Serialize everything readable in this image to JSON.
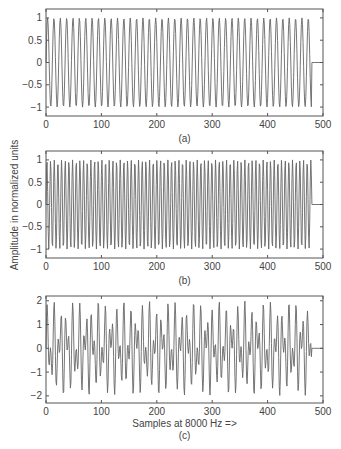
{
  "chart_data": [
    {
      "type": "line",
      "id": "a",
      "caption": "(a)",
      "title": "",
      "xlabel": "",
      "ylabel": "",
      "description": "Sinusoid, approx. 697 Hz sampled at 8000 Hz, amplitude 1",
      "signal": {
        "components": [
          {
            "freq_hz": 697,
            "amplitude": 1
          }
        ],
        "sample_rate_hz": 8000,
        "num_samples": 480
      },
      "xlim": [
        0,
        500
      ],
      "ylim": [
        -1.2,
        1.2
      ],
      "xticks": [
        0,
        100,
        200,
        300,
        400,
        500
      ],
      "xtick_labels": [
        "0",
        "100",
        "200",
        "300",
        "400",
        "500"
      ],
      "yticks": [
        1,
        0.5,
        0,
        -0.5,
        -1
      ],
      "ytick_labels": [
        "1",
        "0.5",
        "0",
        "−0.5",
        "−1"
      ],
      "grid": false,
      "box": {
        "x0": 46,
        "y0": 9,
        "x1": 323,
        "y1": 116
      }
    },
    {
      "type": "line",
      "id": "b",
      "caption": "(b)",
      "title": "",
      "xlabel": "",
      "ylabel": "Amplitude in normalized units",
      "description": "Sinusoid, approx. 1209 Hz sampled at 8000 Hz, amplitude 1",
      "signal": {
        "components": [
          {
            "freq_hz": 1209,
            "amplitude": 1
          }
        ],
        "sample_rate_hz": 8000,
        "num_samples": 480
      },
      "xlim": [
        0,
        500
      ],
      "ylim": [
        -1.2,
        1.2
      ],
      "xticks": [
        0,
        100,
        200,
        300,
        400,
        500
      ],
      "xtick_labels": [
        "0",
        "100",
        "200",
        "300",
        "400",
        "500"
      ],
      "yticks": [
        1,
        0.5,
        0,
        -0.5,
        -1
      ],
      "ytick_labels": [
        "1",
        "0.5",
        "0",
        "−0.5",
        "−1"
      ],
      "grid": false,
      "box": {
        "x0": 46,
        "y0": 151,
        "x1": 323,
        "y1": 258
      }
    },
    {
      "type": "line",
      "id": "c",
      "caption": "(c)",
      "title": "",
      "xlabel": "Samples at 8000 Hz =>",
      "ylabel": "",
      "description": "Sum of the 697 Hz and 1209 Hz sinusoids (DTMF-like tone), peak amplitude about 2",
      "signal": {
        "components": [
          {
            "freq_hz": 697,
            "amplitude": 1
          },
          {
            "freq_hz": 1209,
            "amplitude": 1
          }
        ],
        "sample_rate_hz": 8000,
        "num_samples": 480
      },
      "xlim": [
        0,
        500
      ],
      "ylim": [
        -2.3,
        2.2
      ],
      "xticks": [
        0,
        100,
        200,
        300,
        400,
        500
      ],
      "xtick_labels": [
        "0",
        "100",
        "200",
        "300",
        "400",
        "500"
      ],
      "yticks": [
        2,
        1,
        0,
        -1,
        -2
      ],
      "ytick_labels": [
        "2",
        "1",
        "0",
        "−1",
        "−2"
      ],
      "grid": false,
      "box": {
        "x0": 46,
        "y0": 296,
        "x1": 323,
        "y1": 403
      }
    }
  ],
  "figure": {
    "shared_ylabel": "Amplitude in normalized units",
    "shared_xlabel": "Samples at 8000 Hz =>",
    "line_color": "#666666",
    "axis_color": "#555555",
    "text_color": "#444444"
  }
}
